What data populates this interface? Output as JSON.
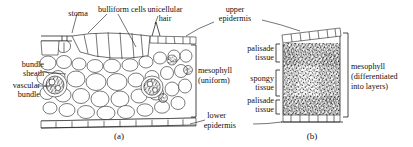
{
  "figure": {
    "panels": [
      {
        "id": "a",
        "caption": "(a)",
        "type": "monocot-leaf-cross-section"
      },
      {
        "id": "b",
        "caption": "(b)",
        "type": "dicot-leaf-cross-section"
      }
    ]
  },
  "labels": {
    "stoma": "stoma",
    "bulliform_cells": "bulliform cells",
    "unicellular_hair_l1": "unicellular",
    "unicellular_hair_l2": "hair",
    "upper_epidermis_l1": "upper",
    "upper_epidermis_l2": "epidermis",
    "bundle_sheath_l1": "bundle",
    "bundle_sheath_l2": "sheath",
    "vascular_bundle_l1": "vascular",
    "vascular_bundle_l2": "bundle",
    "mesophyll_uniform_l1": "mesophyll",
    "mesophyll_uniform_l2": "(uniform)",
    "lower_epidermis_l1": "lower",
    "lower_epidermis_l2": "epidermis",
    "palisade_tissue_top_l1": "palisade",
    "palisade_tissue_top_l2": "tissue",
    "spongy_tissue_l1": "spongy",
    "spongy_tissue_l2": "tissue",
    "palisade_tissue_bottom_l1": "palisade",
    "palisade_tissue_bottom_l2": "tissue",
    "mesophyll_diff_l1": "mesophyll",
    "mesophyll_diff_l2": "(differentiated",
    "mesophyll_diff_l3": "into layers)"
  },
  "colors": {
    "ink": "#1a1a1a",
    "background": "#ffffff",
    "stipple": "#2b2b2b"
  }
}
